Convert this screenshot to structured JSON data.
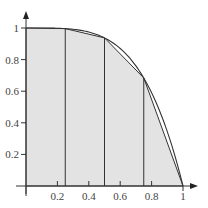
{
  "chart_data": {
    "type": "area",
    "title": "",
    "xlabel": "",
    "ylabel": "",
    "function": "y = 1 - x^4",
    "xlim": [
      0,
      1
    ],
    "ylim": [
      0,
      1
    ],
    "grid": false,
    "x_ticks": [
      0.2,
      0.4,
      0.6,
      0.8,
      1
    ],
    "x_tick_labels": [
      "0.2",
      "0.4",
      "0.6",
      "0.8",
      "1"
    ],
    "y_ticks": [
      0.2,
      0.4,
      0.6,
      0.8,
      1
    ],
    "y_tick_labels": [
      "0.2",
      "0.4",
      "0.6",
      "0.8",
      "1"
    ],
    "trapezoid_nodes": {
      "x": [
        0,
        0.25,
        0.5,
        0.75,
        1
      ],
      "y": [
        1,
        0.996,
        0.9375,
        0.684,
        0
      ]
    },
    "fill_color": "#e3e3e3",
    "line_color": "#333333"
  }
}
